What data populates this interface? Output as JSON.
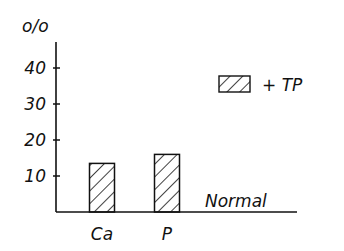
{
  "chart_data": {
    "type": "bar",
    "title": "",
    "ylabel": "%",
    "ylabel_display": "o/o",
    "xlabel": "",
    "categories": [
      "Ca",
      "P"
    ],
    "series": [
      {
        "name": "+ TP",
        "values": [
          13.5,
          16
        ],
        "pattern": "diagonal-hatch"
      }
    ],
    "yticks": [
      10,
      20,
      30,
      40
    ],
    "ytick_labels": [
      "10",
      "20",
      "30",
      "40"
    ],
    "ylim": [
      0,
      50
    ],
    "baseline_label": "Normal",
    "legend": {
      "entries": [
        "+ TP"
      ],
      "placement": "top-right"
    },
    "grid": false
  },
  "colors": {
    "ink": "#111111",
    "background": "#ffffff"
  }
}
